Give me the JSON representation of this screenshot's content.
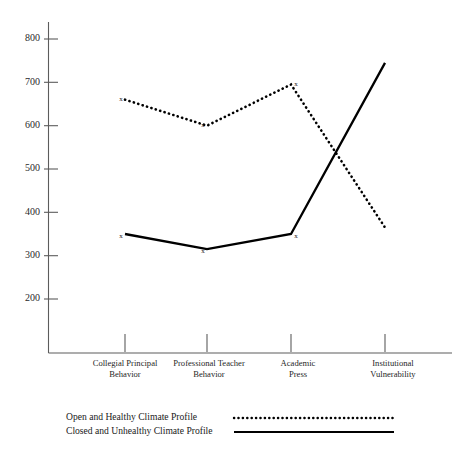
{
  "chart_data": {
    "type": "line",
    "title": "",
    "subtitle": "",
    "xlabel": "",
    "ylabel": "",
    "categories": [
      "Collegial Principal Behavior",
      "Professional Teacher Behavior",
      "Academic Press",
      "Institutional Vulnerability"
    ],
    "category_lines": [
      [
        "Collegial Principal",
        "Behavior"
      ],
      [
        "Professional Teacher",
        "Behavior"
      ],
      [
        "Academic",
        "Press"
      ],
      [
        "Institutional",
        "Vulnerability"
      ]
    ],
    "yticks": [
      800,
      700,
      600,
      500,
      400,
      300,
      200
    ],
    "ytick_labels": [
      "800",
      "700",
      "600",
      "500",
      "400",
      "300",
      "200"
    ],
    "ylim": [
      150,
      860
    ],
    "grid": false,
    "legend_position": "bottom-left",
    "series": [
      {
        "name": "Open and Healthy Climate Profile",
        "style": "dotted",
        "color": "#000000",
        "marker": "x",
        "values": [
          660,
          600,
          695,
          365
        ]
      },
      {
        "name": "Closed and Unhealthy Climate Profile",
        "style": "solid",
        "color": "#000000",
        "marker": "x",
        "values": [
          350,
          315,
          350,
          745
        ]
      }
    ]
  },
  "legend": {
    "items": [
      {
        "label": "Open and Healthy Climate Profile",
        "style": "dotted"
      },
      {
        "label": "Closed and Unhealthy Climate Profile",
        "style": "solid"
      }
    ]
  },
  "axes": {
    "y_axis_name": "value-axis",
    "x_axis_name": "category-axis"
  }
}
